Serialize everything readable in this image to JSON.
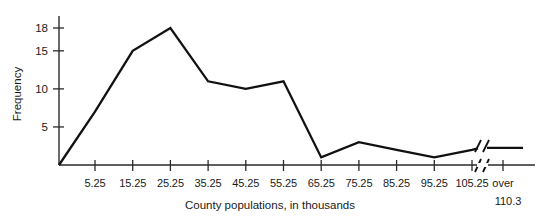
{
  "chart_data": {
    "type": "line",
    "title": "",
    "subtitle": "",
    "xlabel": "County populations, in thousands",
    "ylabel": "Frequency",
    "categories": [
      "5.25",
      "15.25",
      "25.25",
      "35.25",
      "45.25",
      "55.25",
      "65.25",
      "75.25",
      "85.25",
      "95.25",
      "105.25",
      "over 110.3"
    ],
    "x_tick_labels": [
      "5.25",
      "15.25",
      "25.25",
      "35.25",
      "45.25",
      "55.25",
      "65.25",
      "75.25",
      "85.25",
      "95.25",
      "105.25"
    ],
    "x_final_label_line1": "over",
    "x_final_label_line2": "110.3",
    "y_tick_labels": [
      "5",
      "10",
      "15",
      "18"
    ],
    "y_tick_values": [
      5,
      10,
      15,
      18
    ],
    "ylim": [
      0,
      19.5
    ],
    "grid": false,
    "legend": false,
    "legend_position": "none",
    "axis_break": true,
    "axis_break_symbol": "//",
    "series": [
      {
        "name": "Frequency",
        "color": "#111111",
        "points": [
          {
            "x": 0.0,
            "x_label": "origin",
            "y": 0
          },
          {
            "x": 1.0,
            "x_label": "5.25",
            "y": 7
          },
          {
            "x": 2.0,
            "x_label": "15.25",
            "y": 15
          },
          {
            "x": 3.0,
            "x_label": "25.25",
            "y": 18
          },
          {
            "x": 4.0,
            "x_label": "35.25",
            "y": 11
          },
          {
            "x": 5.0,
            "x_label": "45.25",
            "y": 10
          },
          {
            "x": 6.0,
            "x_label": "55.25",
            "y": 11
          },
          {
            "x": 7.0,
            "x_label": "65.25",
            "y": 1
          },
          {
            "x": 8.0,
            "x_label": "75.25",
            "y": 3
          },
          {
            "x": 9.0,
            "x_label": "85.25",
            "y": 2
          },
          {
            "x": 10.0,
            "x_label": "95.25",
            "y": 1
          },
          {
            "x": 11.0,
            "x_label": "105.25",
            "y": 2
          },
          {
            "x": 12.0,
            "x_label": "over 110.3",
            "y": 2
          }
        ]
      }
    ]
  },
  "colors": {
    "background": "#ffffff",
    "axis": "#2a2a2a",
    "line": "#111111",
    "text": "#1a1a1a"
  }
}
